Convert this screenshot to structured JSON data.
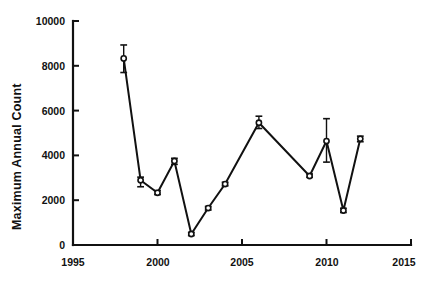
{
  "chart_data": {
    "type": "line",
    "title": "",
    "subtitle": "",
    "xlabel": "",
    "ylabel": "Maximum Annual Count",
    "xlim": [
      1995,
      2015
    ],
    "ylim": [
      0,
      10000
    ],
    "xticks": [
      1995,
      2000,
      2005,
      2010,
      2015
    ],
    "xticklabels": [
      "1995",
      "2000",
      "2005",
      "2010",
      "2015"
    ],
    "yticks": [
      0,
      2000,
      4000,
      6000,
      8000,
      10000
    ],
    "yticklabels": [
      "0",
      "2000",
      "4000",
      "6000",
      "8000",
      "10000"
    ],
    "grid": false,
    "legend": null,
    "marker": "open-circle",
    "errorbars": true,
    "x": [
      1998,
      1999,
      2000,
      2001,
      2002,
      2003,
      2004,
      2006,
      2009,
      2010,
      2011,
      2012
    ],
    "values": [
      8330,
      2890,
      2330,
      3750,
      490,
      1650,
      2720,
      5460,
      3080,
      4640,
      1540,
      4740
    ],
    "err_low": [
      7700,
      2600,
      2250,
      3600,
      420,
      1560,
      2640,
      5200,
      3020,
      3700,
      1450,
      4610
    ],
    "err_high": [
      8930,
      3030,
      2430,
      3870,
      560,
      1720,
      2800,
      5750,
      3170,
      5640,
      1640,
      4860
    ],
    "series": [
      {
        "name": "Maximum Annual Count",
        "values": [
          8330,
          2890,
          2330,
          3750,
          490,
          1650,
          2720,
          5460,
          3080,
          4640,
          1540,
          4740
        ]
      }
    ],
    "points": [
      {
        "year": 1998,
        "value": 8330,
        "low": 7700,
        "high": 8930
      },
      {
        "year": 1999,
        "value": 2890,
        "low": 2600,
        "high": 3030
      },
      {
        "year": 2000,
        "value": 2330,
        "low": 2250,
        "high": 2430
      },
      {
        "year": 2001,
        "value": 3750,
        "low": 3600,
        "high": 3870
      },
      {
        "year": 2002,
        "value": 490,
        "low": 420,
        "high": 560
      },
      {
        "year": 2003,
        "value": 1650,
        "low": 1560,
        "high": 1720
      },
      {
        "year": 2004,
        "value": 2720,
        "low": 2640,
        "high": 2800
      },
      {
        "year": 2006,
        "value": 5460,
        "low": 5200,
        "high": 5750
      },
      {
        "year": 2009,
        "value": 3080,
        "low": 3020,
        "high": 3170
      },
      {
        "year": 2010,
        "value": 4640,
        "low": 3700,
        "high": 5640
      },
      {
        "year": 2011,
        "value": 1540,
        "low": 1450,
        "high": 1640
      },
      {
        "year": 2012,
        "value": 4740,
        "low": 4610,
        "high": 4860
      }
    ],
    "colors": {
      "line": "#111111",
      "marker_fill": "#ffffff",
      "marker_edge": "#111111",
      "axis": "#111111",
      "background": "#ffffff"
    }
  }
}
